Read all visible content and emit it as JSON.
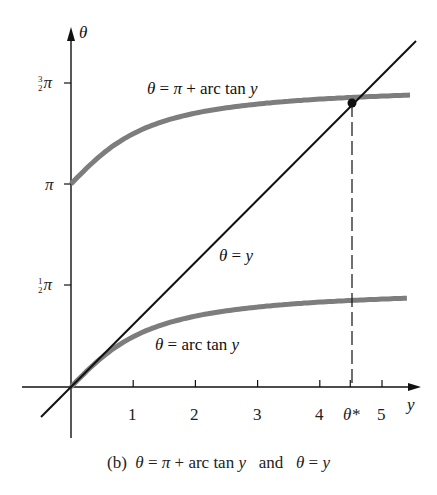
{
  "chart_data": {
    "type": "line",
    "title": "",
    "caption": "(b) θ = π + arc tan y and θ = y",
    "xlabel": "y",
    "ylabel": "θ",
    "x_ticks": [
      "1",
      "2",
      "3",
      "4",
      "θ*",
      "5"
    ],
    "x_tick_values": [
      1,
      2,
      3,
      4,
      4.49,
      5
    ],
    "y_ticks": [
      "½π",
      "π",
      "³⁄₂π"
    ],
    "y_tick_values": [
      1.5708,
      3.1416,
      4.7124
    ],
    "xlim": [
      -0.5,
      5.6
    ],
    "ylim": [
      -0.5,
      5.6
    ],
    "grid": false,
    "series": [
      {
        "name": "θ = π + arc tan y",
        "style": "thick gray",
        "x": [
          0,
          0.5,
          1,
          2,
          3,
          4,
          4.49,
          5,
          5.5
        ],
        "values": [
          3.1416,
          3.6052,
          3.927,
          4.2487,
          4.3906,
          4.4674,
          4.4934,
          4.515,
          4.5318
        ]
      },
      {
        "name": "θ = arc tan y",
        "style": "thick gray",
        "x": [
          0,
          0.5,
          1,
          2,
          3,
          4,
          5,
          5.5
        ],
        "values": [
          0,
          0.4636,
          0.7854,
          1.1071,
          1.249,
          1.3258,
          1.3734,
          1.3902
        ]
      },
      {
        "name": "θ = y",
        "style": "thin black",
        "x": [
          -0.5,
          5.5
        ],
        "values": [
          -0.5,
          5.5
        ]
      }
    ],
    "annotations": [
      {
        "text": "θ*",
        "x": 4.49,
        "note": "intersection of θ = π + arc tan y and θ = y, dashed vertical drop line"
      }
    ]
  },
  "labels": {
    "upper_curve": "θ = π + arc tan y",
    "lower_curve": "θ = arc tan y",
    "diagonal": "θ = y",
    "y_axis": "θ",
    "x_axis": "y",
    "tick_pi": "π",
    "tick_half_pi_suffix": "π",
    "tick_three_half_pi_suffix": "π",
    "frac_half_num": "1",
    "frac_half_den": "2",
    "frac_three_half_num": "3",
    "frac_three_half_den": "2",
    "x_tick_1": "1",
    "x_tick_2": "2",
    "x_tick_3": "3",
    "x_tick_4": "4",
    "x_tick_theta_star": "θ*",
    "x_tick_5": "5"
  },
  "caption": "(b)  θ = π + arc tan y   and   θ = y",
  "colors": {
    "curve": "#7d7d7d",
    "axis": "#111111"
  }
}
